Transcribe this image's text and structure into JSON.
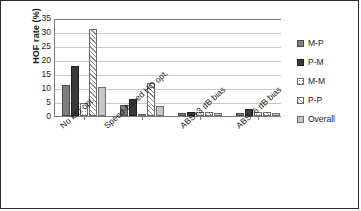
{
  "chart_data": {
    "type": "bar",
    "title": "",
    "subtitle": "",
    "xlabel": "",
    "ylabel": "HOF rate (%)",
    "ylim": [
      0,
      35
    ],
    "ytick_step": 5,
    "yticks": [
      35,
      30,
      25,
      20,
      15,
      10,
      5,
      0
    ],
    "grid": "horizontal",
    "legend_position": "right",
    "categories": [
      "No HO opt.",
      "Speed-based HO opt.",
      "ABS+3 dB bias",
      "ABS+6 dB bias"
    ],
    "series": [
      {
        "name": "M-P",
        "values": [
          11.2,
          4.0,
          1.1,
          1.2
        ]
      },
      {
        "name": "P-M",
        "values": [
          18.0,
          6.1,
          1.3,
          2.6
        ]
      },
      {
        "name": "M-M",
        "values": [
          4.5,
          0.8,
          1.4,
          1.3
        ]
      },
      {
        "name": "P-P",
        "values": [
          31.2,
          11.7,
          1.5,
          1.5
        ]
      },
      {
        "name": "Overall",
        "values": [
          10.5,
          3.6,
          1.2,
          1.2
        ]
      }
    ],
    "series_styles": [
      "medium-gray-solid",
      "dark-gray-solid",
      "white-dotted",
      "white-diagonal-hatch",
      "light-gray-solid"
    ]
  },
  "legend": {
    "items": [
      {
        "label": "M-P",
        "swatch": "legend-swatch-m-p"
      },
      {
        "label": "P-M",
        "swatch": "legend-swatch-p-m"
      },
      {
        "label": "M-M",
        "swatch": "legend-swatch-m-m"
      },
      {
        "label": "P-P",
        "swatch": "legend-swatch-p-p"
      },
      {
        "label": "Overall",
        "swatch": "legend-swatch-overall"
      }
    ]
  },
  "colors": {
    "m_p": "#7f7f7f",
    "p_m": "#3a3a3a",
    "m_m": "#ffffff",
    "p_p": "#ffffff",
    "overall": "#c6c6c6",
    "axis": "#7c7c7c",
    "grid": "#c9c9c9",
    "text": "#1a1a1a",
    "border": "#2b2b2b"
  }
}
